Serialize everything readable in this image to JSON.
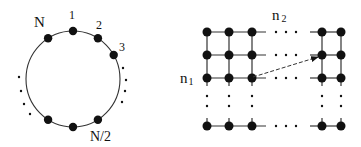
{
  "ring": {
    "labels": {
      "n": "N",
      "one": "1",
      "two": "2",
      "three": "3",
      "half": "N/2"
    },
    "center": [
      73,
      79
    ],
    "radii": [
      47,
      48
    ],
    "node_angles_deg": [
      -122,
      -90,
      -58,
      -30,
      122,
      90,
      58
    ],
    "ellipsis_left": [
      [
        19,
        77
      ],
      [
        21,
        91
      ],
      [
        24,
        104
      ],
      [
        30,
        114
      ]
    ],
    "ellipsis_right": [
      [
        123,
        68
      ],
      [
        126,
        80
      ],
      [
        125,
        91
      ],
      [
        122,
        102
      ]
    ]
  },
  "mesh": {
    "labels": {
      "rows": "n₁",
      "cols": "n₂"
    },
    "row_label_sub": "1",
    "col_label_sub": "2",
    "col_x": [
      207,
      229,
      252,
      322,
      341
    ],
    "row_y": [
      32,
      55,
      78,
      126
    ],
    "arrow": {
      "from": [
        253,
        77
      ],
      "to": [
        318,
        57
      ]
    }
  },
  "colors": {
    "ink": "#111111",
    "line": "#333333",
    "background": "#ffffff"
  }
}
